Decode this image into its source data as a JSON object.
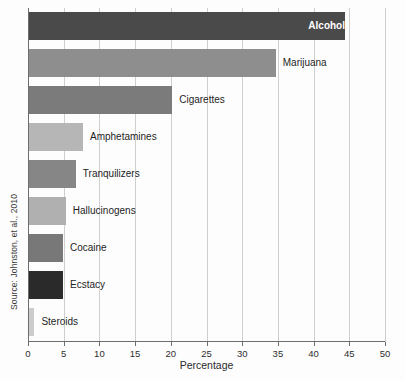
{
  "chart_data": {
    "type": "bar",
    "orientation": "horizontal",
    "title": "",
    "xlabel": "Percentage",
    "ylabel": "",
    "xlim": [
      0,
      50
    ],
    "xticks": [
      0,
      5,
      10,
      15,
      20,
      25,
      30,
      35,
      40,
      45,
      50
    ],
    "xtick_labels": [
      "0",
      "5",
      "10",
      "15",
      "20",
      "25",
      "30",
      "35",
      "40",
      "45",
      "50"
    ],
    "grid": "vertical",
    "legend": "none",
    "source_note": "Source: Johnston, et al., 2010",
    "categories": [
      "Alcohol",
      "Marijuana",
      "Cigarettes",
      "Amphetamines",
      "Tranquilizers",
      "Hallucinogens",
      "Cocaine",
      "Ecstacy",
      "Steroids"
    ],
    "values": [
      44.4,
      34.7,
      20.2,
      7.7,
      6.7,
      5.3,
      4.9,
      4.9,
      0.9
    ],
    "bars": [
      {
        "label": "Alcohol",
        "value": 44.4,
        "color": "#4a4a4a",
        "label_position": "inside"
      },
      {
        "label": "Marijuana",
        "value": 34.7,
        "color": "#8e8e8e",
        "label_position": "outside"
      },
      {
        "label": "Cigarettes",
        "value": 20.2,
        "color": "#7b7b7b",
        "label_position": "outside"
      },
      {
        "label": "Amphetamines",
        "value": 7.7,
        "color": "#b6b6b6",
        "label_position": "outside"
      },
      {
        "label": "Tranquilizers",
        "value": 6.7,
        "color": "#868686",
        "label_position": "outside"
      },
      {
        "label": "Hallucinogens",
        "value": 5.3,
        "color": "#b0b0b0",
        "label_position": "outside"
      },
      {
        "label": "Cocaine",
        "value": 4.9,
        "color": "#787878",
        "label_position": "outside"
      },
      {
        "label": "Ecstacy",
        "value": 4.9,
        "color": "#2a2a2a",
        "label_position": "outside"
      },
      {
        "label": "Steroids",
        "value": 0.9,
        "color": "#cccccc",
        "label_position": "outside"
      }
    ],
    "colors": {
      "axis": "#6e6e6e",
      "gridline": "#cfcfcf",
      "background": "#fdfdfd",
      "text": "#2b2b2b",
      "inside_label_text": "#ffffff"
    }
  }
}
